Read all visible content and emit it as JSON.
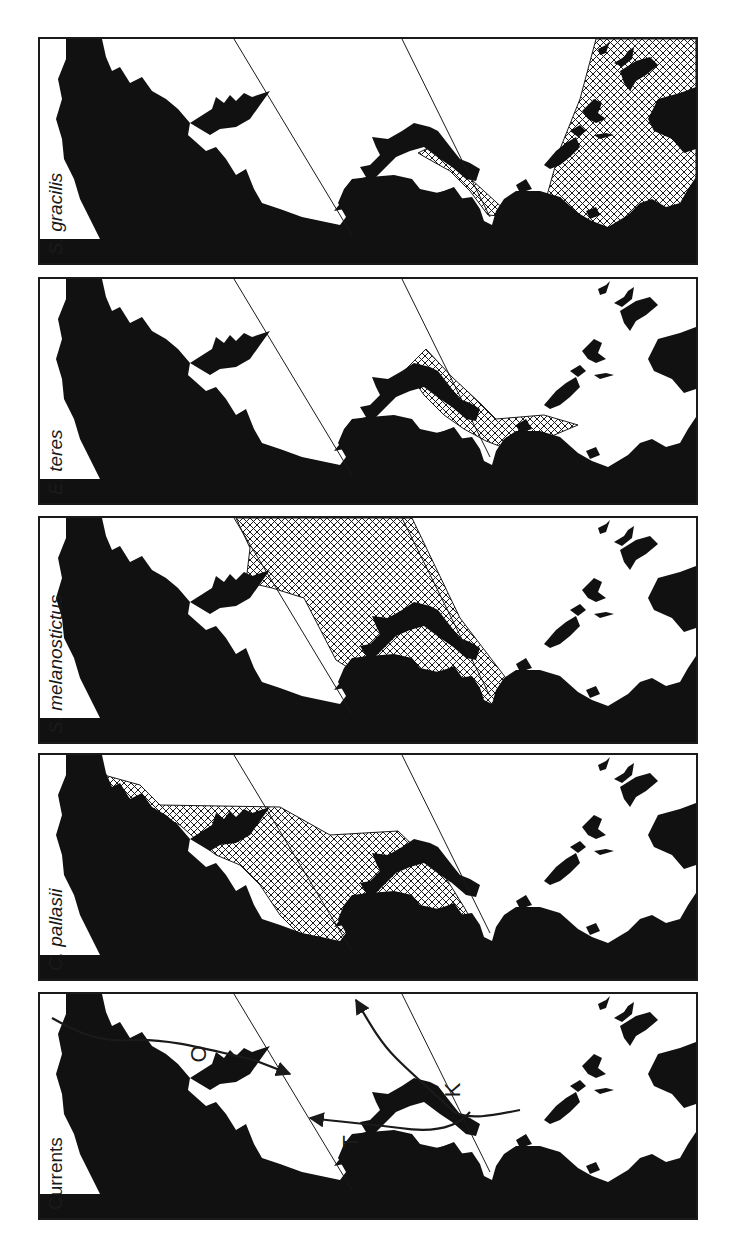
{
  "figure": {
    "orientation": "rotated 90° counter-clockwise",
    "panels": [
      {
        "id": "s-gracilis",
        "label": "S. gracilis",
        "italic": true,
        "range_shown": true
      },
      {
        "id": "e-teres",
        "label": "E. teres",
        "italic": true,
        "range_shown": true
      },
      {
        "id": "s-melanostictus",
        "label": "S. melanostictus",
        "italic": true,
        "range_shown": true
      },
      {
        "id": "c-pallasii",
        "label": "C. pallasii",
        "italic": true,
        "range_shown": true
      },
      {
        "id": "currents",
        "label": "Currents",
        "italic": false,
        "range_shown": false
      }
    ],
    "currents": {
      "labels": [
        "O",
        "K",
        "T"
      ]
    },
    "legend": {
      "land": "black fill",
      "range": "cross-hatched area",
      "reference_lines": "two thin diagonal lines"
    },
    "colors": {
      "land": "#111111",
      "border": "#1a1a1a",
      "hatch": "#1a1a1a",
      "background": "#ffffff"
    }
  }
}
